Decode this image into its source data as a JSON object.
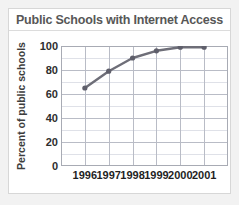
{
  "card": {
    "title": "Public Schools with Internet Access"
  },
  "axes": {
    "y_title": "Percent of public schools",
    "y_ticks": [
      "100",
      "80",
      "60",
      "40",
      "20",
      "0"
    ],
    "x_ticks": [
      "1996",
      "1997",
      "1998",
      "1999",
      "2000",
      "2001"
    ]
  },
  "colors": {
    "line": "#6e6e78",
    "marker": "#5f5f6b",
    "grid_major": "#b9bcc6",
    "grid_minor": "#dfe1e8",
    "axis": "#9a9aa2",
    "title_text": "#575757",
    "tick_text": "#1f1f1f",
    "card_bg": "#ffffff",
    "page_bg": "#f2f2f2"
  },
  "chart_data": {
    "type": "line",
    "title": "Public Schools with Internet Access",
    "xlabel": "",
    "ylabel": "Percent of public schools",
    "categories": [
      "1996",
      "1997",
      "1998",
      "1999",
      "2000",
      "2001"
    ],
    "values": [
      65,
      79,
      90,
      96,
      99,
      99
    ],
    "ylim": [
      0,
      100
    ],
    "y_tick_step": 20,
    "y_gridline_step": 10,
    "grid": true,
    "legend": false,
    "markers": true
  }
}
